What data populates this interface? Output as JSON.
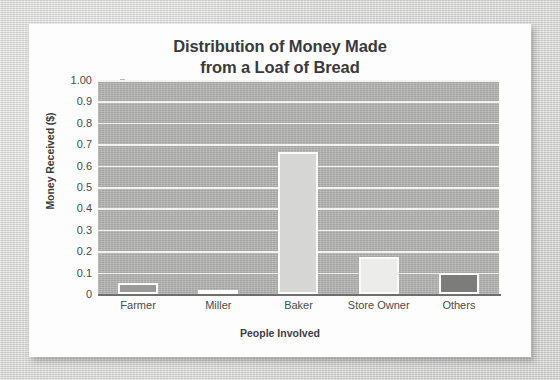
{
  "chart_data": {
    "type": "bar",
    "title": "Distribution of Money Made from a Loaf of Bread",
    "title_lines": [
      "Distribution of Money Made",
      "from a Loaf of Bread"
    ],
    "xlabel": "People Involved",
    "ylabel": "Money Received ($)",
    "categories": [
      "Farmer",
      "Miller",
      "Baker",
      "Store Owner",
      "Others"
    ],
    "values": [
      0.05,
      0.01,
      0.665,
      0.175,
      0.1
    ],
    "ylim": [
      0,
      1.0
    ],
    "ytick_labels": [
      "0",
      "0.1",
      "0.2",
      "0.3",
      "0.4",
      "0.5",
      "0.6",
      "0.7",
      "0.8",
      "0.9",
      "1.00"
    ],
    "ytick_values": [
      0,
      0.1,
      0.2,
      0.3,
      0.4,
      0.5,
      0.6,
      0.7,
      0.8,
      0.9,
      1.0
    ],
    "grid": true,
    "grid_axis": "y",
    "legend": false,
    "bar_colors": [
      "#9a9a98",
      "#4a4a48",
      "#d6d6d4",
      "#ececea",
      "#7c7c7a"
    ],
    "bar_edge_color": "#fbfbf9",
    "plot_background": "#b4b4b2",
    "gridline_color": "#f2f2f0",
    "text_color": "#3c3c3c",
    "page_background": "#dbdbd9",
    "card_background": "#fdfdfd"
  }
}
